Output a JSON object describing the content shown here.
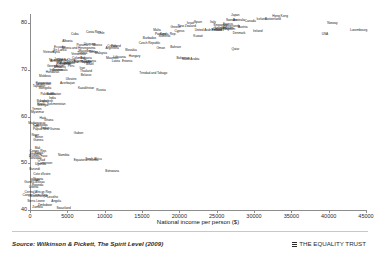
{
  "chart_data": {
    "type": "scatter",
    "title": "",
    "xlabel": "National income per person ($)",
    "ylabel": "Life expectancy (years)",
    "xlim": [
      0,
      45000
    ],
    "ylim": [
      40,
      82
    ],
    "xticks": [
      0,
      5000,
      10000,
      15000,
      20000,
      25000,
      30000,
      35000,
      40000,
      45000
    ],
    "xtick_labels": [
      "0",
      "5000",
      "10000",
      "15000",
      "20000",
      "25000",
      "30000",
      "35000",
      "40000",
      "45000"
    ],
    "yticks": [
      40,
      50,
      60,
      70,
      80
    ],
    "ytick_labels": [
      "40",
      "50",
      "60",
      "70",
      "80"
    ],
    "grid": false,
    "legend": null,
    "marker_style": "text-label",
    "points": [
      {
        "label": "Japan",
        "x": 27500,
        "y": 81.5
      },
      {
        "label": "Hong Kong",
        "x": 33500,
        "y": 81.3
      },
      {
        "label": "Iceland",
        "x": 31000,
        "y": 80.8
      },
      {
        "label": "Switzerland",
        "x": 32500,
        "y": 80.7
      },
      {
        "label": "Australia",
        "x": 28000,
        "y": 80.5
      },
      {
        "label": "Sweden",
        "x": 27000,
        "y": 80.4
      },
      {
        "label": "Canada",
        "x": 29500,
        "y": 80.2
      },
      {
        "label": "Italy",
        "x": 24500,
        "y": 80.1
      },
      {
        "label": "Spain",
        "x": 22500,
        "y": 80.0
      },
      {
        "label": "Israel",
        "x": 21500,
        "y": 79.9
      },
      {
        "label": "Norway",
        "x": 40500,
        "y": 79.8
      },
      {
        "label": "France",
        "x": 26500,
        "y": 79.7
      },
      {
        "label": "Singapore",
        "x": 25500,
        "y": 79.5
      },
      {
        "label": "New Zealand",
        "x": 21000,
        "y": 79.3
      },
      {
        "label": "Netherlands",
        "x": 27000,
        "y": 79.2
      },
      {
        "label": "Austria",
        "x": 28500,
        "y": 79.1
      },
      {
        "label": "Greece",
        "x": 19500,
        "y": 78.9
      },
      {
        "label": "Belgium",
        "x": 26500,
        "y": 78.8
      },
      {
        "label": "Germany",
        "x": 25500,
        "y": 78.7
      },
      {
        "label": "United Kingdom",
        "x": 26000,
        "y": 78.5
      },
      {
        "label": "Finland",
        "x": 25000,
        "y": 78.4
      },
      {
        "label": "Malta",
        "x": 17000,
        "y": 78.4
      },
      {
        "label": "Ireland",
        "x": 30500,
        "y": 78.2
      },
      {
        "label": "Cyprus",
        "x": 20000,
        "y": 78.2
      },
      {
        "label": "Denmark",
        "x": 28000,
        "y": 77.8
      },
      {
        "label": "Portugal",
        "x": 17500,
        "y": 77.6
      },
      {
        "label": "Slovenia",
        "x": 18000,
        "y": 77.0
      },
      {
        "label": "Costa Rica",
        "x": 8500,
        "y": 77.9
      },
      {
        "label": "Chile",
        "x": 9500,
        "y": 77.7
      },
      {
        "label": "Cuba",
        "x": 6000,
        "y": 77.6
      },
      {
        "label": "Korea, Rep.",
        "x": 18500,
        "y": 77.5
      },
      {
        "label": "USA",
        "x": 39500,
        "y": 77.4
      },
      {
        "label": "Czech Republic",
        "x": 16000,
        "y": 75.6
      },
      {
        "label": "Kuwait",
        "x": 22500,
        "y": 77.1
      },
      {
        "label": "Uruguay",
        "x": 8000,
        "y": 75.4
      },
      {
        "label": "Argentina",
        "x": 11000,
        "y": 74.6
      },
      {
        "label": "Mexico",
        "x": 9000,
        "y": 75.1
      },
      {
        "label": "Poland",
        "x": 11500,
        "y": 74.9
      },
      {
        "label": "Croatia",
        "x": 11000,
        "y": 75.0
      },
      {
        "label": "Slovakia",
        "x": 13500,
        "y": 74.0
      },
      {
        "label": "Hungary",
        "x": 14000,
        "y": 72.8
      },
      {
        "label": "Bahrain",
        "x": 19500,
        "y": 74.8
      },
      {
        "label": "Qatar",
        "x": 27500,
        "y": 74.3
      },
      {
        "label": "United Arab Emirates",
        "x": 24000,
        "y": 78.3
      },
      {
        "label": "Saudi Arabia",
        "x": 21500,
        "y": 72.2
      },
      {
        "label": "Oman",
        "x": 17500,
        "y": 74.5
      },
      {
        "label": "Estonia",
        "x": 13000,
        "y": 71.8
      },
      {
        "label": "Lithuania",
        "x": 12000,
        "y": 72.5
      },
      {
        "label": "Latvia",
        "x": 11500,
        "y": 71.8
      },
      {
        "label": "Bulgaria",
        "x": 7500,
        "y": 72.4
      },
      {
        "label": "Romania",
        "x": 8000,
        "y": 71.7
      },
      {
        "label": "Malaysia",
        "x": 9500,
        "y": 73.5
      },
      {
        "label": "Panama",
        "x": 7000,
        "y": 75.1
      },
      {
        "label": "Venezuela",
        "x": 6500,
        "y": 73.2
      },
      {
        "label": "Colombia",
        "x": 6500,
        "y": 72.3
      },
      {
        "label": "Brazil",
        "x": 8000,
        "y": 71.0
      },
      {
        "label": "Thailand",
        "x": 7500,
        "y": 69.6
      },
      {
        "label": "China",
        "x": 5500,
        "y": 71.9
      },
      {
        "label": "Sri Lanka",
        "x": 4000,
        "y": 74.0
      },
      {
        "label": "Albania",
        "x": 5000,
        "y": 75.9
      },
      {
        "label": "Armenia",
        "x": 3500,
        "y": 71.7
      },
      {
        "label": "Georgia",
        "x": 3000,
        "y": 70.6
      },
      {
        "label": "Ukraine",
        "x": 5500,
        "y": 67.9
      },
      {
        "label": "Russia",
        "x": 9500,
        "y": 65.4
      },
      {
        "label": "Belarus",
        "x": 7500,
        "y": 68.7
      },
      {
        "label": "Kazakhstan",
        "x": 7500,
        "y": 65.9
      },
      {
        "label": "Moldova",
        "x": 2000,
        "y": 68.4
      },
      {
        "label": "Uzbekistan",
        "x": 1800,
        "y": 66.8
      },
      {
        "label": "Kyrgyzstan",
        "x": 1800,
        "y": 67.1
      },
      {
        "label": "Tajikistan",
        "x": 1200,
        "y": 66.3
      },
      {
        "label": "Turkey",
        "x": 7500,
        "y": 71.4
      },
      {
        "label": "Iran",
        "x": 7000,
        "y": 70.2
      },
      {
        "label": "Jordan",
        "x": 4500,
        "y": 71.9
      },
      {
        "label": "Tunisia",
        "x": 7000,
        "y": 73.5
      },
      {
        "label": "Algeria",
        "x": 6500,
        "y": 71.7
      },
      {
        "label": "Morocco",
        "x": 4000,
        "y": 70.4
      },
      {
        "label": "Egypt",
        "x": 4000,
        "y": 70.7
      },
      {
        "label": "Syria",
        "x": 3500,
        "y": 73.6
      },
      {
        "label": "Vietnam",
        "x": 2500,
        "y": 73.7
      },
      {
        "label": "Indonesia",
        "x": 3500,
        "y": 69.7
      },
      {
        "label": "Philippines",
        "x": 4500,
        "y": 71.0
      },
      {
        "label": "India",
        "x": 3000,
        "y": 63.7
      },
      {
        "label": "Pakistan",
        "x": 2200,
        "y": 64.6
      },
      {
        "label": "Bangladesh",
        "x": 2000,
        "y": 63.1
      },
      {
        "label": "Nepal",
        "x": 1500,
        "y": 62.6
      },
      {
        "label": "Mongolia",
        "x": 2000,
        "y": 65.9
      },
      {
        "label": "Bolivia",
        "x": 2800,
        "y": 64.7
      },
      {
        "label": "Guatemala",
        "x": 4000,
        "y": 69.7
      },
      {
        "label": "Nicaragua",
        "x": 3500,
        "y": 71.9
      },
      {
        "label": "Honduras",
        "x": 3000,
        "y": 69.4
      },
      {
        "label": "Paraguay",
        "x": 4500,
        "y": 71.3
      },
      {
        "label": "Peru",
        "x": 5500,
        "y": 70.7
      },
      {
        "label": "Ecuador",
        "x": 4000,
        "y": 74.7
      },
      {
        "label": "Jamaica",
        "x": 4000,
        "y": 72.2
      },
      {
        "label": "Dominican Republic",
        "x": 6500,
        "y": 71.5
      },
      {
        "label": "El Salvador",
        "x": 5000,
        "y": 71.3
      },
      {
        "label": "Ghana",
        "x": 2500,
        "y": 59.1
      },
      {
        "label": "Senegal",
        "x": 1700,
        "y": 62.3
      },
      {
        "label": "Sudan",
        "x": 2000,
        "y": 57.4
      },
      {
        "label": "Yemen",
        "x": 900,
        "y": 61.5
      },
      {
        "label": "Cambodia",
        "x": 1400,
        "y": 58.0
      },
      {
        "label": "Myanmar",
        "x": 1000,
        "y": 60.8
      },
      {
        "label": "Laos",
        "x": 1800,
        "y": 63.2
      },
      {
        "label": "Papua New Guinea",
        "x": 2200,
        "y": 57.2
      },
      {
        "label": "Kenya",
        "x": 1200,
        "y": 52.1
      },
      {
        "label": "Gabon",
        "x": 6500,
        "y": 56.2
      },
      {
        "label": "Namibia",
        "x": 4500,
        "y": 51.6
      },
      {
        "label": "South Africa",
        "x": 8500,
        "y": 50.8
      },
      {
        "label": "Botswana",
        "x": 11000,
        "y": 48.1
      },
      {
        "label": "Equatorial Guinea",
        "x": 7500,
        "y": 50.4
      },
      {
        "label": "Nigeria",
        "x": 1100,
        "y": 46.5
      },
      {
        "label": "Cameroon",
        "x": 2000,
        "y": 49.8
      },
      {
        "label": "Congo, Rep.",
        "x": 1100,
        "y": 52.5
      },
      {
        "label": "Tanzania",
        "x": 700,
        "y": 51.0
      },
      {
        "label": "Uganda",
        "x": 1400,
        "y": 49.7
      },
      {
        "label": "Ethiopia",
        "x": 700,
        "y": 51.8
      },
      {
        "label": "Madagascar",
        "x": 900,
        "y": 58.4
      },
      {
        "label": "Mali",
        "x": 1000,
        "y": 53.1
      },
      {
        "label": "Burkina Faso",
        "x": 1100,
        "y": 51.4
      },
      {
        "label": "Niger",
        "x": 700,
        "y": 55.8
      },
      {
        "label": "Chad",
        "x": 1500,
        "y": 50.4
      },
      {
        "label": "Guinea",
        "x": 1100,
        "y": 54.8
      },
      {
        "label": "Benin",
        "x": 1200,
        "y": 55.4
      },
      {
        "label": "Togo",
        "x": 800,
        "y": 57.8
      },
      {
        "label": "Rwanda",
        "x": 1000,
        "y": 45.2
      },
      {
        "label": "Malawi",
        "x": 700,
        "y": 46.3
      },
      {
        "label": "Burundi",
        "x": 600,
        "y": 48.5
      },
      {
        "label": "Mozambique",
        "x": 1200,
        "y": 42.8
      },
      {
        "label": "Zambia",
        "x": 1000,
        "y": 40.5
      },
      {
        "label": "Zimbabwe",
        "x": 2000,
        "y": 40.9
      },
      {
        "label": "Lesotho",
        "x": 3000,
        "y": 42.6
      },
      {
        "label": "Swaziland",
        "x": 4500,
        "y": 40.2
      },
      {
        "label": "Angola",
        "x": 3500,
        "y": 41.7
      },
      {
        "label": "Congo, Dem. Rep.",
        "x": 700,
        "y": 43.1
      },
      {
        "label": "Central African Rep.",
        "x": 1100,
        "y": 43.7
      },
      {
        "label": "Sierra Leone",
        "x": 800,
        "y": 41.8
      },
      {
        "label": "Liberia",
        "x": 500,
        "y": 44.7
      },
      {
        "label": "Guinea-Bissau",
        "x": 600,
        "y": 45.8
      },
      {
        "label": "Cote d'Ivoire",
        "x": 1600,
        "y": 47.4
      },
      {
        "label": "Haiti",
        "x": 1700,
        "y": 59.5
      },
      {
        "label": "Bhutan",
        "x": 3500,
        "y": 64.7
      },
      {
        "label": "Turkmenistan",
        "x": 3500,
        "y": 62.6
      },
      {
        "label": "Azerbaijan",
        "x": 5000,
        "y": 67.1
      },
      {
        "label": "Macedonia",
        "x": 7500,
        "y": 73.8
      },
      {
        "label": "Bosnia and Herzegovina",
        "x": 6500,
        "y": 74.5
      },
      {
        "label": "Serbia",
        "x": 8500,
        "y": 73.6
      },
      {
        "label": "Mauritius",
        "x": 11000,
        "y": 72.4
      },
      {
        "label": "Trinidad and Tobago",
        "x": 16500,
        "y": 69.2
      },
      {
        "label": "Barbados",
        "x": 16000,
        "y": 76.6
      },
      {
        "label": "Bahamas",
        "x": 20500,
        "y": 72.4
      },
      {
        "label": "Luxembourg",
        "x": 44000,
        "y": 78.4
      }
    ]
  },
  "footer": {
    "source": "Source: Wilkinson & Pickett, The Spirit Level (2009)",
    "brand": "THE EQUALITY TRUST",
    "brand_mark_icon": "grid-bars-icon"
  }
}
